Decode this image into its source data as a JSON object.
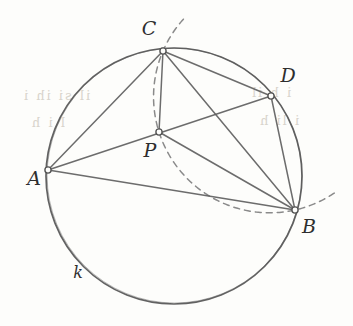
{
  "figure": {
    "kind": "euclidean-geometry-diagram",
    "caption_labels": {
      "point_a": "A",
      "point_b": "B",
      "point_c": "C",
      "point_d": "D",
      "point_p": "P",
      "circle_k": "k"
    },
    "colors": {
      "background": "#fdfdfb",
      "ink": "#555555",
      "ink_dark": "#2e2e2e",
      "circle_stroke": "#5a5a5a",
      "chord_stroke": "#606060",
      "dashed_stroke": "#8a8a8a",
      "node_fill": "#fdfdfb",
      "bleed_text": "#d8d4cc"
    },
    "circle": {
      "name": "k",
      "cx": 174,
      "cy": 176,
      "r": 128
    },
    "points": [
      {
        "id": "A",
        "label": "A",
        "x": 48,
        "y": 170,
        "label_x": 34,
        "label_y": 178
      },
      {
        "id": "B",
        "label": "B",
        "x": 295,
        "y": 210,
        "label_x": 309,
        "label_y": 226
      },
      {
        "id": "C",
        "label": "C",
        "x": 163,
        "y": 51,
        "label_x": 149,
        "label_y": 28
      },
      {
        "id": "D",
        "label": "D",
        "x": 271,
        "y": 96,
        "label_x": 288,
        "label_y": 75
      },
      {
        "id": "P",
        "label": "P",
        "x": 159,
        "y": 132,
        "label_x": 150,
        "label_y": 150
      }
    ],
    "segments": [
      {
        "from": "A",
        "to": "C"
      },
      {
        "from": "A",
        "to": "B"
      },
      {
        "from": "A",
        "to": "D"
      },
      {
        "from": "C",
        "to": "B"
      },
      {
        "from": "C",
        "to": "D"
      },
      {
        "from": "D",
        "to": "B"
      },
      {
        "from": "C",
        "to": "P"
      },
      {
        "from": "P",
        "to": "B"
      }
    ],
    "dashed_arc": {
      "description": "dashed circular arc through C, P and B with tails beyond both endpoints",
      "through": [
        "C",
        "P",
        "B"
      ],
      "tail_start": {
        "x": 181,
        "y": 17
      },
      "tail_end": {
        "x": 336,
        "y": 191
      }
    },
    "circle_label": {
      "text": "k",
      "x": 78,
      "y": 273
    },
    "bleed_through": [
      {
        "text": "il si   ih i",
        "x": 22,
        "y": 95
      },
      {
        "text": "i  h  il",
        "x": 250,
        "y": 92
      },
      {
        "text": "l  i  h",
        "x": 30,
        "y": 122
      },
      {
        "text": "i   li  h",
        "x": 258,
        "y": 120
      }
    ]
  }
}
